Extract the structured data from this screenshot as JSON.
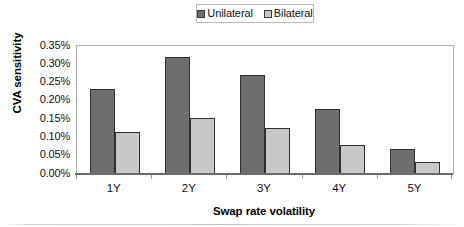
{
  "chart_data": {
    "type": "bar",
    "title": "",
    "subtitle": "",
    "xlabel": "Swap rate volatility",
    "ylabel": "CVA sensitivity",
    "categories": [
      "1Y",
      "2Y",
      "3Y",
      "4Y",
      "5Y"
    ],
    "series": [
      {
        "name": "Unilateral",
        "values": [
          0.233,
          0.32,
          0.272,
          0.179,
          0.069
        ],
        "color": "#6e6e6e"
      },
      {
        "name": "Bilateral",
        "values": [
          0.115,
          0.152,
          0.125,
          0.08,
          0.033
        ],
        "color": "#c8c8c8"
      }
    ],
    "value_unit": "%",
    "ylim": [
      0.0,
      0.35
    ],
    "ytick_values": [
      0.35,
      0.3,
      0.25,
      0.2,
      0.15,
      0.1,
      0.05,
      0.0
    ],
    "ytick_labels": [
      "0.35%",
      "0.30%",
      "0.25%",
      "0.20%",
      "0.15%",
      "0.10%",
      "0.05%",
      "0.00%"
    ],
    "grid": false,
    "legend_position": "top-center",
    "legend_entries": [
      "Unilateral",
      "Bilateral"
    ],
    "annotations": []
  },
  "legend": {
    "entries": [
      {
        "label": "Unilateral",
        "swatch_class": "series-unilateral"
      },
      {
        "label": "Bilateral",
        "swatch_class": "series-bilateral"
      }
    ]
  },
  "axes": {
    "y_title": "CVA sensitivity",
    "x_title": "Swap rate volatility"
  },
  "colors": {
    "unilateral": "#6e6e6e",
    "bilateral": "#c8c8c8",
    "bar_outline": "#2f2f2f",
    "plot_frame": "#b0b0b0",
    "axis_line": "#6b6b6b",
    "text": "#111111"
  }
}
